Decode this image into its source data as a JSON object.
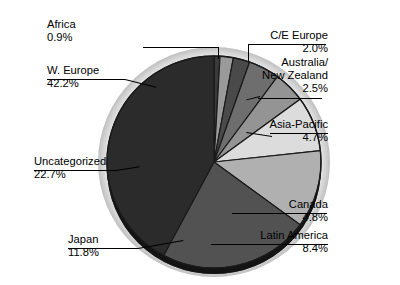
{
  "chart_data": {
    "type": "pie",
    "title": "",
    "subtitle": "",
    "xlabel": "",
    "ylabel": "",
    "legend_position": "callout-labels",
    "grid": false,
    "units": "percent",
    "total": "100.0%",
    "start_angle_deg": 0,
    "direction": "clockwise",
    "categories": [
      "Africa",
      "C/E Europe",
      "Australia/ New Zealand",
      "Asia-Pacific",
      "Canada",
      "Latin America",
      "Japan",
      "Uncategorized",
      "W. Europe"
    ],
    "values": [
      0.9,
      2.0,
      2.5,
      4.7,
      4.8,
      8.4,
      11.8,
      22.7,
      42.2
    ],
    "slices": [
      {
        "name": "Africa",
        "value": 0.9,
        "value_label": "0.9%",
        "color": "#3a3a3a"
      },
      {
        "name": "C/E Europe",
        "value": 2.0,
        "value_label": "2.0%",
        "color": "#9a9a9a"
      },
      {
        "name": "Australia/ New Zealand",
        "value": 2.5,
        "value_label": "2.5%",
        "color": "#4a4a4a"
      },
      {
        "name": "Asia-Pacific",
        "value": 4.7,
        "value_label": "4.7%",
        "color": "#6e6e6e"
      },
      {
        "name": "Canada",
        "value": 4.8,
        "value_label": "4.8%",
        "color": "#949494"
      },
      {
        "name": "Latin America",
        "value": 8.4,
        "value_label": "8.4%",
        "color": "#dcdcdc"
      },
      {
        "name": "Japan",
        "value": 11.8,
        "value_label": "11.8%",
        "color": "#b0b0b0"
      },
      {
        "name": "Uncategorized",
        "value": 22.7,
        "value_label": "22.7%",
        "color": "#525252"
      },
      {
        "name": "W. Europe",
        "value": 42.2,
        "value_label": "42.2%",
        "color": "#2b2b2b"
      }
    ]
  },
  "labels": {
    "africa": {
      "name": "Africa",
      "value": "0.9%"
    },
    "w_europe": {
      "name": "W. Europe",
      "value": "42.2%"
    },
    "ce_europe": {
      "name": "C/E Europe",
      "value": "2.0%"
    },
    "australia_l1": "Australia/",
    "australia_l2": "New Zealand",
    "australia_val": "2.5%",
    "asia_pacific": {
      "name": "Asia-Pacific",
      "value": "4.7%"
    },
    "canada": {
      "name": "Canada",
      "value": "4.8%"
    },
    "latin_america": {
      "name": "Latin America",
      "value": "8.4%"
    },
    "japan": {
      "name": "Japan",
      "value": "11.8%"
    },
    "uncategorized": {
      "name": "Uncategorized",
      "value": "22.7%"
    }
  },
  "style": {
    "background": "#ffffff",
    "text_color": "#000000",
    "edge_color": "#1a1a1a"
  }
}
